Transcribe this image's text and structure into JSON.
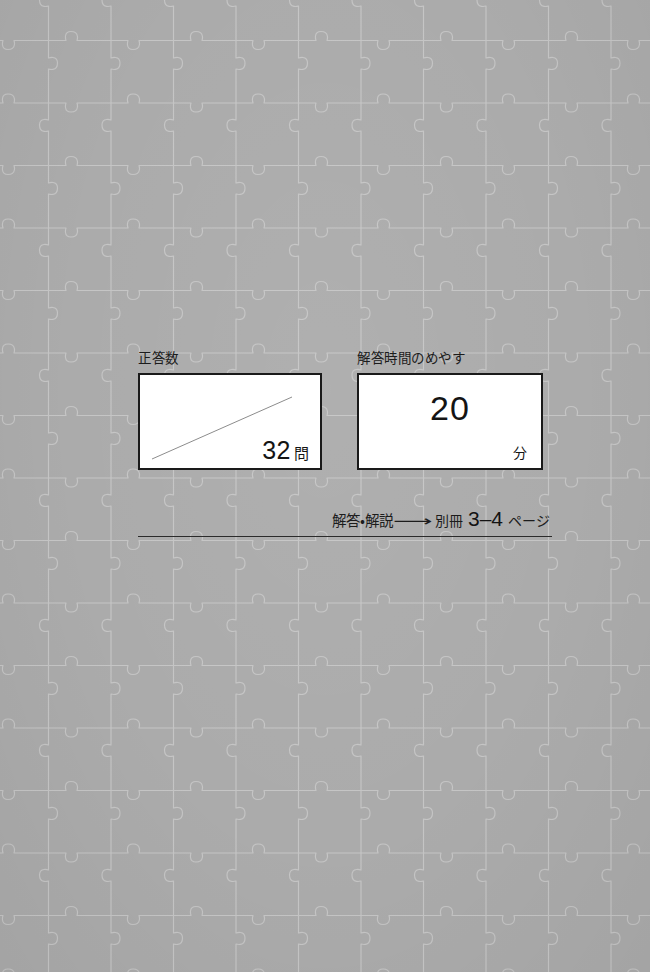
{
  "page": {
    "background_color": "#ababab",
    "pattern_name": "jigsaw-puzzle-pieces",
    "pattern_line_color": "#c9c9c9"
  },
  "score_field": {
    "label": "正答数",
    "value": "",
    "value_suffix": "32",
    "unit": "問",
    "blank_rule": "diagonal-write-in-line"
  },
  "time_field": {
    "label": "解答時間のめやす",
    "value": "20",
    "unit": "分"
  },
  "answer_reference": {
    "prefix": "解答・解説",
    "arrow": "⟶",
    "booklet": "別冊",
    "pages": "3–4",
    "page_suffix": "ページ"
  }
}
